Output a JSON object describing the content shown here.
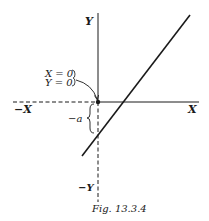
{
  "figure": {
    "caption": "Fig. 13.3.4",
    "axes": {
      "x_positive_label": "X",
      "x_negative_label": "−X",
      "y_positive_label": "Y",
      "y_negative_label": "−Y"
    },
    "annotations": {
      "origin_line1": "X = 0",
      "origin_line2": "Y = 0",
      "intercept_label": "−a"
    },
    "colors": {
      "ink": "#1a1a1a",
      "background": "#ffffff"
    }
  }
}
